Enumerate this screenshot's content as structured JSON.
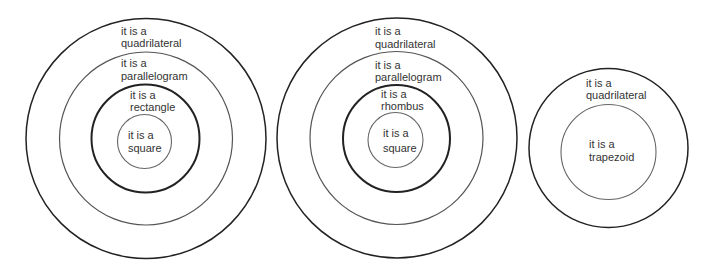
{
  "diagram": {
    "groups": [
      {
        "name": "square-rectangle-hierarchy",
        "rings": [
          {
            "label_line1": "it is a",
            "label_line2": "quadrilateral"
          },
          {
            "label_line1": "it is a",
            "label_line2": "parallelogram"
          },
          {
            "label_line1": "it is a",
            "label_line2": "rectangle"
          },
          {
            "label_line1": "it is a",
            "label_line2": "square"
          }
        ]
      },
      {
        "name": "square-rhombus-hierarchy",
        "rings": [
          {
            "label_line1": "it is a",
            "label_line2": "quadrilateral"
          },
          {
            "label_line1": "it is a",
            "label_line2": "parallelogram"
          },
          {
            "label_line1": "it is a",
            "label_line2": "rhombus"
          },
          {
            "label_line1": "it is a",
            "label_line2": "square"
          }
        ]
      },
      {
        "name": "trapezoid-hierarchy",
        "rings": [
          {
            "label_line1": "it is a",
            "label_line2": "quadrilateral"
          },
          {
            "label_line1": "it is a",
            "label_line2": "trapezoid"
          }
        ]
      }
    ],
    "colors": {
      "stroke_dark": "#222222",
      "stroke_mid": "#555555",
      "stroke_light": "#666666",
      "text": "#333333",
      "background": "#ffffff"
    }
  }
}
